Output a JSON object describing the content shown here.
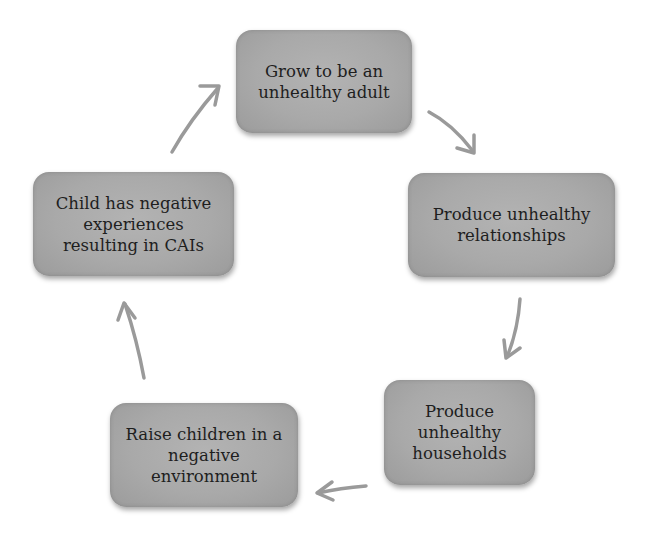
{
  "diagram": {
    "type": "cycle",
    "nodes": [
      {
        "id": "n1",
        "label": "Grow to be an unhealthy adult",
        "lines": [
          "Grow to be an",
          "unhealthy adult"
        ]
      },
      {
        "id": "n2",
        "label": "Produce unhealthy relationships",
        "lines": [
          "Produce unhealthy",
          "relationships"
        ]
      },
      {
        "id": "n3",
        "label": "Produce unhealthy households",
        "lines": [
          "Produce",
          "unhealthy",
          "households"
        ]
      },
      {
        "id": "n4",
        "label": "Raise children in a negative environment",
        "lines": [
          "Raise children in a",
          "negative",
          "environment"
        ]
      },
      {
        "id": "n5",
        "label": "Child has negative experiences resulting in CAIs",
        "lines": [
          "Child has negative",
          "experiences",
          "resulting in CAIs"
        ]
      }
    ],
    "edges": [
      {
        "from": "n1",
        "to": "n2"
      },
      {
        "from": "n2",
        "to": "n3"
      },
      {
        "from": "n3",
        "to": "n4"
      },
      {
        "from": "n4",
        "to": "n5"
      },
      {
        "from": "n5",
        "to": "n1"
      }
    ],
    "colors": {
      "node_fill": "#a9a9a9",
      "node_text": "#1e1e1e",
      "arrow": "#9a9a9a",
      "background": "#ffffff"
    }
  }
}
